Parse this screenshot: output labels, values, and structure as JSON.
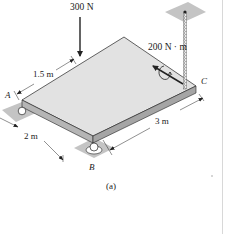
{
  "figure": {
    "caption": "(a)",
    "colors": {
      "plate_top": "#e2e2e2",
      "plate_edge": "#b5b5b5",
      "support_pad": "#c4c4c4",
      "line": "#222222"
    }
  },
  "loads": {
    "force": {
      "label": "300 N",
      "direction": "down"
    },
    "moment": {
      "label": "200 N · m"
    }
  },
  "points": {
    "a": "A",
    "b": "B",
    "c": "C"
  },
  "dimensions": {
    "d1": "1.5 m",
    "d2": "2 m",
    "d3": "3 m"
  }
}
